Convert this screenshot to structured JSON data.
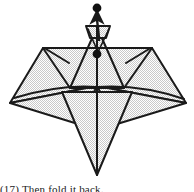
{
  "figure": {
    "kind": "origami-folding-diagram",
    "step_label": "(17)",
    "caption_text": "(17) Then fold it back.",
    "background_color": "#ffffff",
    "stroke_color": "#1a1a1a",
    "paper_fill_color": "#e8e8e8",
    "paper_fill_pattern": "halftone-dither",
    "canvas": {
      "width": 194,
      "height": 192
    }
  },
  "markers": {
    "top_dot": {
      "name": "target-point-dot",
      "cx": 97,
      "cy": 8,
      "r": 4.2
    },
    "center_dot": {
      "name": "pivot-point-dot",
      "cx": 97,
      "cy": 54,
      "r": 4.2
    }
  },
  "arrow": {
    "name": "fold-up-arrow",
    "label": "fold direction arrow pointing up",
    "tail_x": 99,
    "tail_y": 40,
    "head_x": 97,
    "head_y": 14
  },
  "shapes": {
    "left_wing": {
      "name": "left-wing-flap",
      "points": "43,48 10,103 97,86"
    },
    "left_wing_lower": {
      "name": "left-lower-flap",
      "points": "10,103 97,86 78,122"
    },
    "left_inner_triangle": {
      "name": "left-inner-triangle",
      "points": "43,48 97,48 70,88"
    },
    "right_wing": {
      "name": "right-wing-flap",
      "points": "152,48 186,103 97,86"
    },
    "right_wing_lower": {
      "name": "right-lower-flap",
      "points": "186,103 97,86 117,122"
    },
    "right_inner_triangle": {
      "name": "right-inner-triangle",
      "points": "152,48 97,48 124,88"
    },
    "center_peak": {
      "name": "center-peak-triangle",
      "points": "97,27 70,88 124,88"
    },
    "bottom_point": {
      "name": "bottom-point-triangle",
      "points": "60,92 134,92 97,175"
    },
    "top_flap": {
      "name": "top-small-flap",
      "points": "86,26 110,26 106,38 90,38"
    }
  },
  "crease_lines": {
    "center_vertical": {
      "name": "center-vertical-crease",
      "x1": 97,
      "y1": 27,
      "x2": 97,
      "y2": 175
    },
    "horizontal_band": {
      "name": "horizontal-fold-line",
      "x1": 70,
      "y1": 88,
      "x2": 124,
      "y2": 88
    },
    "left_short_crease": {
      "name": "left-short-crease",
      "x1": 46,
      "y1": 49,
      "x2": 68,
      "y2": 62
    },
    "right_short_crease": {
      "name": "right-short-crease",
      "x1": 149,
      "y1": 49,
      "x2": 127,
      "y2": 62
    },
    "top_v_left": {
      "name": "top-v-crease-left",
      "x1": 88,
      "y1": 29,
      "x2": 97,
      "y2": 50
    },
    "top_v_right": {
      "name": "top-v-crease-right",
      "x1": 108,
      "y1": 29,
      "x2": 97,
      "y2": 50
    }
  }
}
